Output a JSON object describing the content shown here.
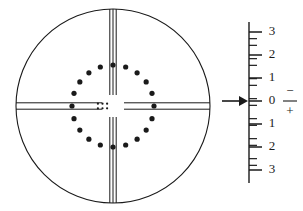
{
  "figure": {
    "name": "optical-reticle-with-vernier-scale",
    "background_color": "#ffffff",
    "line_color": "#1a1a1a",
    "width": 303,
    "height": 211
  },
  "reticle": {
    "name": "reticle-field-of-view",
    "center_x": 113,
    "center_y": 106,
    "outer_circle": {
      "name": "field-circle",
      "radius": 97,
      "stroke_width": 1.1
    },
    "vertical_crosshair": {
      "name": "vertical-crosshair",
      "line_count": 3,
      "offsets": [
        -3.2,
        0,
        3.2
      ],
      "stroke_width": 1.0,
      "center_gap": 11
    },
    "horizontal_crosshair": {
      "name": "horizontal-crosshair",
      "line_count": 2,
      "offsets": [
        -3.2,
        3.2
      ],
      "stroke_width": 1.0,
      "center_gap": 11
    },
    "dot_ring": {
      "name": "dot-ring",
      "dot_count": 20,
      "ring_radius": 41,
      "dot_radius": 2.6,
      "start_angle_deg": -90
    },
    "center_dot_grid": {
      "name": "center-dot-grid",
      "columns": 3,
      "rows": 2,
      "dot_radius": 1.1,
      "col_spacing": 4.6,
      "row_spacing": 4.6,
      "offset_x": -10.5,
      "offset_y": 0
    }
  },
  "scale": {
    "name": "vernier-scale",
    "axis_x": 249,
    "axis_top_y": 22,
    "axis_bottom_y": 183,
    "axis_stroke_width": 1.4,
    "zero_y": 101,
    "major_spacing": 20,
    "major_tick_length": 13,
    "minor_tick_length": 8,
    "minors_per_major": 2,
    "labels": [
      {
        "text": "3",
        "value": 3,
        "y": 32
      },
      {
        "text": "2",
        "value": 2,
        "y": 55
      },
      {
        "text": "1",
        "value": 1,
        "y": 78
      },
      {
        "text": "0",
        "value": 0,
        "y": 101
      },
      {
        "text": "1",
        "value": -1,
        "y": 124
      },
      {
        "text": "2",
        "value": -2,
        "y": 147
      },
      {
        "text": "3",
        "value": -3,
        "y": 170
      }
    ],
    "label_x": 272
  },
  "indicator_arrow": {
    "name": "indicator-arrow",
    "points_to_value": 0,
    "tail_x": 222,
    "tip_x": 248,
    "y": 101,
    "head_length": 9,
    "head_half_height": 5,
    "shaft_width": 1.6
  },
  "sign_legend": {
    "name": "polarity-legend",
    "minus_symbol": "−",
    "plus_symbol": "+",
    "divider": true,
    "x": 290,
    "minus_y": 92,
    "divider_y": 101,
    "plus_y": 112,
    "divider_half_width": 7
  }
}
